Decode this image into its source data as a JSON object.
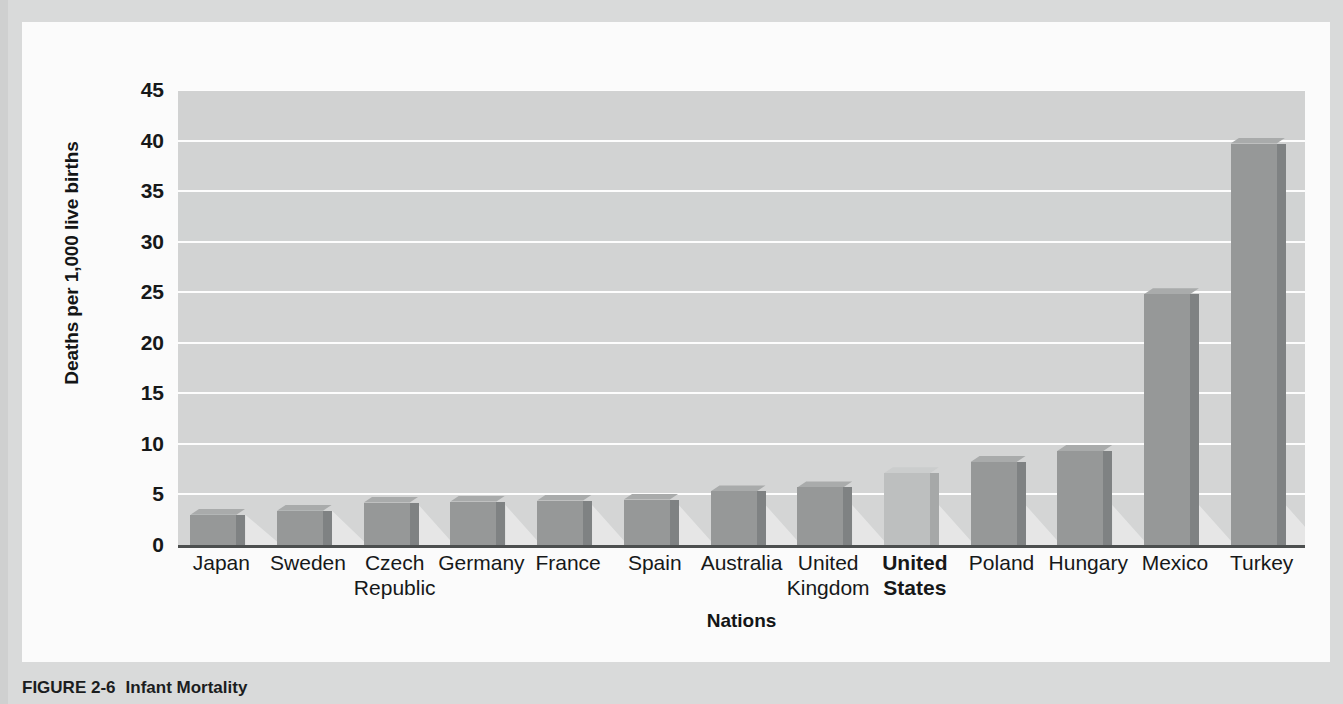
{
  "figure": {
    "caption_number": "FIGURE 2-6",
    "caption_title": "Infant Mortality"
  },
  "colors": {
    "plot_background": "#d5d6d6",
    "gridline": "#fdfdfd",
    "bar_fill": "#969898",
    "bar_side": "#7f8283",
    "bar_top": "#a9abab",
    "highlight_bar_fill": "#bdbfbf",
    "axis": "#4c4f4f",
    "panel_background": "#fbfbfb",
    "frame_background": "#d9dada",
    "text": "#161819"
  },
  "chart_data": {
    "type": "bar",
    "title": "Infant Mortality",
    "xlabel": "Nations",
    "ylabel": "Deaths per 1,000 live births",
    "ylim": [
      0,
      45
    ],
    "ytick_labels": [
      "45",
      "40",
      "35",
      "30",
      "25",
      "20",
      "15",
      "10",
      "5",
      "0"
    ],
    "ytick_values": [
      45,
      40,
      35,
      30,
      25,
      20,
      15,
      10,
      5,
      0
    ],
    "grid": true,
    "legend": "none",
    "highlight_category": "United States",
    "categories": [
      "Japan",
      "Sweden",
      "Czech Republic",
      "Germany",
      "France",
      "Spain",
      "Australia",
      "United Kingdom",
      "United States",
      "Poland",
      "Hungary",
      "Mexico",
      "Turkey"
    ],
    "category_lines": [
      [
        "Japan"
      ],
      [
        "Sweden"
      ],
      [
        "Czech",
        "Republic"
      ],
      [
        "Germany"
      ],
      [
        "France"
      ],
      [
        "Spain"
      ],
      [
        "Australia"
      ],
      [
        "United",
        "Kingdom"
      ],
      [
        "United",
        "States"
      ],
      [
        "Poland"
      ],
      [
        "Hungary"
      ],
      [
        "Mexico"
      ],
      [
        "Turkey"
      ]
    ],
    "values": [
      3.0,
      3.4,
      4.2,
      4.3,
      4.4,
      4.5,
      5.3,
      5.7,
      7.1,
      8.2,
      9.3,
      24.8,
      39.7
    ]
  }
}
